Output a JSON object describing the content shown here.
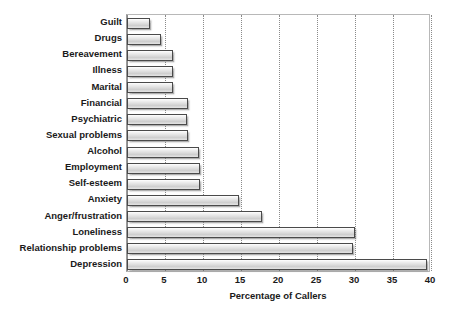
{
  "chart_data": {
    "type": "bar",
    "orientation": "horizontal",
    "title": "",
    "xlabel": "Percentage of Callers",
    "ylabel": "",
    "xlim": [
      0,
      40
    ],
    "xticks": [
      0,
      5,
      10,
      15,
      20,
      25,
      30,
      35,
      40
    ],
    "grid": "vertical-dotted",
    "legend": "none",
    "categories": [
      "Guilt",
      "Drugs",
      "Bereavement",
      "Illness",
      "Marital",
      "Financial",
      "Psychiatric",
      "Sexual problems",
      "Alcohol",
      "Employment",
      "Self-esteem",
      "Anxiety",
      "Anger/frustration",
      "Loneliness",
      "Relationship problems",
      "Depression"
    ],
    "values": [
      3.0,
      4.5,
      6.0,
      6.0,
      6.1,
      8.0,
      7.9,
      8.0,
      9.5,
      9.6,
      9.6,
      14.8,
      17.8,
      30.0,
      29.8,
      39.5
    ],
    "bar_fill": "#dddddd",
    "bar_border": "#4a4a4a",
    "grid_color": "#8a8a8a",
    "text_color": "#1a1a1a"
  }
}
